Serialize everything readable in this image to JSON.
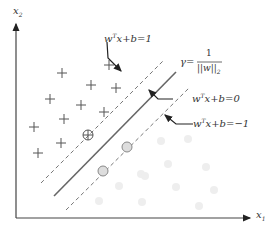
{
  "diagram": {
    "axes": {
      "x_label": "x",
      "x_sub": "1",
      "y_label": "x",
      "y_sub": "2"
    },
    "labels": {
      "upper_margin": {
        "w": "w",
        "sup": "T",
        "rest": "x+b=1"
      },
      "hyperplane": {
        "w": "w",
        "sup": "T",
        "rest": "x+b=0"
      },
      "lower_margin": {
        "w": "w",
        "sup": "T",
        "rest": "x+b=−1"
      },
      "gamma": {
        "lhs": "γ=",
        "num": "1",
        "den": "||w||",
        "den_sub": "2"
      }
    },
    "classes": {
      "positive": {
        "marker": "plus",
        "count": 11,
        "support_vectors": 1
      },
      "negative": {
        "marker": "circle",
        "count": 12,
        "support_vectors": 2
      }
    },
    "colors": {
      "line": "#555555",
      "dashed": "#777777",
      "plus": "#555555",
      "circle_sv_fill": "#dddddd",
      "circle_faint": "#eeeeee"
    }
  }
}
